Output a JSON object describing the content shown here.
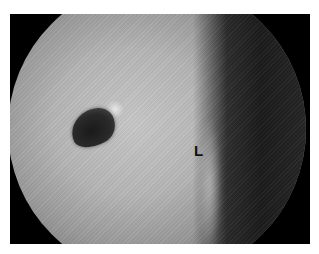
{
  "image": {
    "description": "Circular endoscopic view inside a black frame showing a dark oval opening and a tissue boundary",
    "annotations": [
      {
        "label": "L"
      }
    ],
    "colors": {
      "frame": "#000000",
      "field_light": "#c9c9c9",
      "field_dark": "#1c1c1c",
      "label": "#111111"
    }
  }
}
